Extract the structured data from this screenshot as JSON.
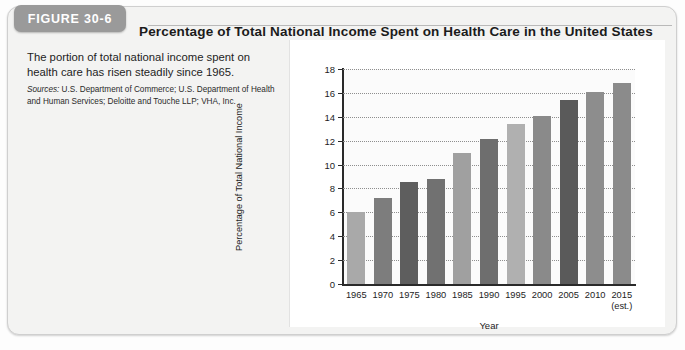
{
  "figure": {
    "tab_label": "FIGURE 30-6",
    "title": "Percentage of Total National Income Spent on Health Care in the United States",
    "caption": "The portion of total national income spent on health care has risen steadily since 1965.",
    "sources_label": "Sources:",
    "sources_text": " U.S. Department of Commerce; U.S. Department of Health and Human Services; Deloitte and Touche LLP; VHA, Inc."
  },
  "colors": {
    "tab_background": "#9a9a9a",
    "panel_background": "#f3f3f2",
    "chart_background": "#ffffff",
    "bar_light": "#a9a9a9",
    "bar_dark": "#6f6f6f",
    "axis": "#2a2a2a",
    "gridline": "#8e8e8e"
  },
  "chart_data": {
    "type": "bar",
    "title": "Percentage of Total National Income Spent on Health Care in the United States",
    "xlabel": "Year",
    "ylabel": "Percentage of Total National Income",
    "categories": [
      "1965",
      "1970",
      "1975",
      "1980",
      "1985",
      "1990",
      "1995",
      "2000",
      "2005",
      "2010",
      "2015"
    ],
    "category_sublabels": [
      "",
      "",
      "",
      "",
      "",
      "",
      "",
      "",
      "",
      "",
      "(est.)"
    ],
    "values": [
      6.0,
      7.2,
      8.5,
      8.8,
      11.0,
      12.1,
      13.4,
      14.1,
      15.4,
      16.1,
      16.8
    ],
    "bar_colors": [
      "#a9a9a9",
      "#7d7d7d",
      "#5e5e5e",
      "#717171",
      "#a0a0a0",
      "#6e6e6e",
      "#b0b0b0",
      "#8a8a8a",
      "#5a5a5a",
      "#8d8d8d",
      "#8b8b8b"
    ],
    "ylim": [
      0,
      18
    ],
    "yticks": [
      0,
      2,
      4,
      6,
      8,
      10,
      12,
      14,
      16,
      18
    ],
    "ytick_labels": [
      "0",
      "2",
      "4",
      "6",
      "8",
      "10",
      "12",
      "14",
      "16",
      "18"
    ],
    "grid": true,
    "grid_style": "dotted-horizontal",
    "legend": false
  }
}
